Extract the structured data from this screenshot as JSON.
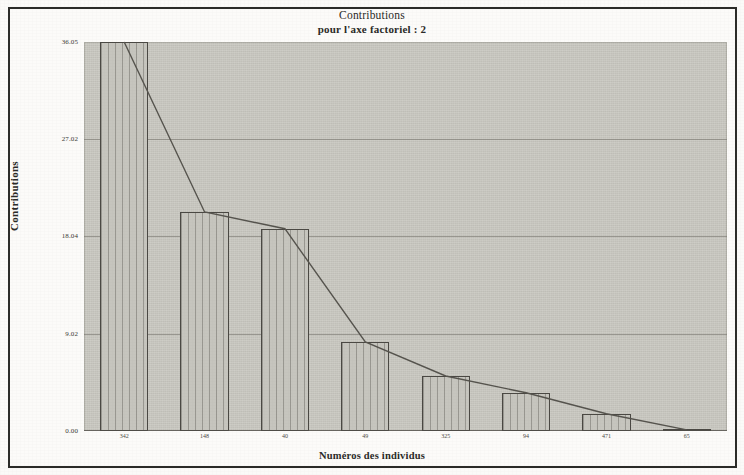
{
  "chart_data": {
    "type": "bar",
    "title": "Contributions",
    "subtitle": "pour l'axe factoriel : 2",
    "xlabel": "Numéros des individus",
    "ylabel": "Contributions",
    "categories": [
      "342",
      "148",
      "40",
      "49",
      "325",
      "94",
      "471",
      "65"
    ],
    "values": [
      36.05,
      20.3,
      18.75,
      8.25,
      5.1,
      3.55,
      1.6,
      0.1
    ],
    "series": [
      {
        "name": "Contributions",
        "type": "bar",
        "values": [
          36.05,
          20.3,
          18.75,
          8.25,
          5.1,
          3.55,
          1.6,
          0.1
        ]
      },
      {
        "name": "Courbe cumulée",
        "type": "line",
        "values": [
          36.05,
          20.3,
          18.75,
          8.25,
          5.1,
          3.55,
          1.6,
          0.1
        ]
      }
    ],
    "ylim": [
      0.0,
      36.05
    ],
    "ytick_labels": [
      "36.05",
      "27.02",
      "18.04",
      "9.02",
      "0.00"
    ],
    "ytick_values": [
      36.05,
      27.02,
      18.04,
      9.02,
      0.0
    ],
    "grid": true,
    "legend": "none",
    "colors": {
      "plot_background": "#c9c8c1",
      "bar_fill": "#c6c5be",
      "bar_stroke": "#4a4843",
      "line": "#55534d",
      "gridline": "#6e6c64",
      "text": "#2a2a27",
      "frame": "#2b2b28"
    }
  }
}
